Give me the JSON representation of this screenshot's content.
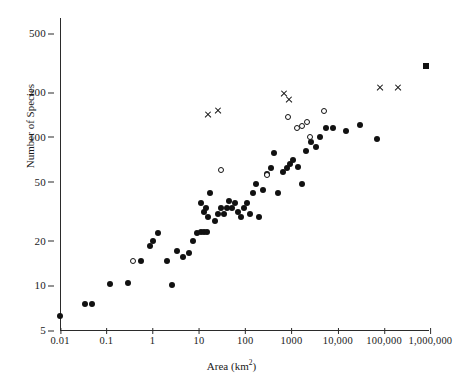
{
  "chart_data": {
    "type": "scatter",
    "title": "",
    "xlabel": "Area (km2)",
    "ylabel": "Number of Species",
    "xscale": "log",
    "yscale": "log",
    "xlim": [
      0.01,
      2000000
    ],
    "ylim": [
      5,
      600
    ],
    "grid": false,
    "legend": "none",
    "xticks": [
      {
        "value": 0.01,
        "label": "0.01"
      },
      {
        "value": 0.1,
        "label": "0.1"
      },
      {
        "value": 1,
        "label": "1"
      },
      {
        "value": 10,
        "label": "10"
      },
      {
        "value": 100,
        "label": "100"
      },
      {
        "value": 1000,
        "label": "1000"
      },
      {
        "value": 10000,
        "label": "10,000"
      },
      {
        "value": 100000,
        "label": "100,000"
      },
      {
        "value": 1000000,
        "label": "1,000,000"
      }
    ],
    "yticks": [
      {
        "value": 500,
        "label": "500"
      },
      {
        "value": 200,
        "label": "200"
      },
      {
        "value": 100,
        "label": "100"
      },
      {
        "value": 50,
        "label": "50"
      },
      {
        "value": 20,
        "label": "20"
      },
      {
        "value": 10,
        "label": "10"
      },
      {
        "value": 5,
        "label": "5"
      }
    ],
    "series": [
      {
        "name": "filled-circle",
        "marker": "filled-circle",
        "points": [
          [
            0.01,
            6.2
          ],
          [
            0.035,
            7.5
          ],
          [
            0.05,
            7.5
          ],
          [
            0.12,
            10.2
          ],
          [
            0.3,
            10.3
          ],
          [
            0.55,
            14.5
          ],
          [
            0.9,
            18.5
          ],
          [
            1.0,
            20.0
          ],
          [
            1.3,
            22.5
          ],
          [
            2.0,
            14.5
          ],
          [
            2.6,
            10.0
          ],
          [
            3.4,
            17.0
          ],
          [
            4.5,
            15.5
          ],
          [
            6.0,
            16.5
          ],
          [
            7.5,
            20.0
          ],
          [
            9.0,
            22.5
          ],
          [
            11.0,
            23.0
          ],
          [
            13.0,
            23.0
          ],
          [
            15.0,
            23.0
          ],
          [
            16.0,
            29.0
          ],
          [
            13.0,
            31.0
          ],
          [
            14.5,
            33.0
          ],
          [
            11.0,
            36.0
          ],
          [
            17.0,
            42.0
          ],
          [
            22.0,
            27.0
          ],
          [
            26.0,
            30.0
          ],
          [
            30.0,
            33.0
          ],
          [
            34.0,
            30.0
          ],
          [
            40.0,
            33.0
          ],
          [
            45.0,
            37.0
          ],
          [
            52.0,
            33.0
          ],
          [
            60.0,
            36.0
          ],
          [
            70.0,
            31.0
          ],
          [
            80.0,
            29.0
          ],
          [
            95.0,
            33.0
          ],
          [
            110.0,
            36.0
          ],
          [
            130.0,
            30.0
          ],
          [
            150.0,
            42.0
          ],
          [
            170.0,
            48.0
          ],
          [
            200.0,
            29.0
          ],
          [
            240.0,
            44.0
          ],
          [
            300.0,
            56.0
          ],
          [
            360.0,
            62.0
          ],
          [
            420.0,
            78.0
          ],
          [
            520.0,
            42.0
          ],
          [
            650.0,
            58.0
          ],
          [
            800.0,
            62.0
          ],
          [
            950.0,
            66.0
          ],
          [
            1100.0,
            70.0
          ],
          [
            1400.0,
            63.0
          ],
          [
            1700.0,
            48.0
          ],
          [
            2100.0,
            80.0
          ],
          [
            2600.0,
            92.0
          ],
          [
            3400.0,
            85.0
          ],
          [
            4200.0,
            100.0
          ],
          [
            5500.0,
            115.0
          ],
          [
            8000.0,
            115.0
          ],
          [
            15000.0,
            110.0
          ],
          [
            30000.0,
            120.0
          ],
          [
            70000.0,
            97.0
          ]
        ]
      },
      {
        "name": "open-circle",
        "marker": "open-circle",
        "points": [
          [
            0.38,
            14.5
          ],
          [
            30.0,
            60.0
          ],
          [
            300.0,
            55.0
          ],
          [
            820.0,
            135.0
          ],
          [
            1300.0,
            115.0
          ],
          [
            1700.0,
            118.0
          ],
          [
            2200.0,
            125.0
          ],
          [
            2500.0,
            100.0
          ],
          [
            5000.0,
            150.0
          ]
        ]
      },
      {
        "name": "cross",
        "marker": "cross",
        "points": [
          [
            16.0,
            140.0
          ],
          [
            26.0,
            150.0
          ],
          [
            700.0,
            195.0
          ],
          [
            900.0,
            178.0
          ],
          [
            80000.0,
            215.0
          ],
          [
            200000.0,
            215.0
          ]
        ]
      },
      {
        "name": "filled-square",
        "marker": "filled-square",
        "points": [
          [
            800000.0,
            300.0
          ]
        ]
      }
    ]
  }
}
